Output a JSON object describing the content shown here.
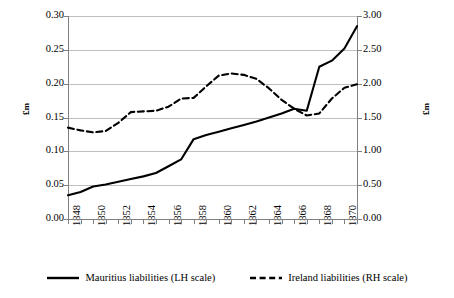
{
  "chart_data": {
    "type": "line",
    "title": "",
    "xlabel": "",
    "ylabel": "£m",
    "y2label": "£m",
    "grid": true,
    "legend_position": "bottom",
    "x": [
      1848,
      1849,
      1850,
      1851,
      1852,
      1853,
      1854,
      1855,
      1856,
      1857,
      1858,
      1859,
      1860,
      1861,
      1862,
      1863,
      1864,
      1865,
      1866,
      1867,
      1868,
      1869,
      1870,
      1871
    ],
    "xtick_labels": [
      "1848",
      "1850",
      "1852",
      "1854",
      "1856",
      "1858",
      "1860",
      "1862",
      "1864",
      "1866",
      "1868",
      "1870"
    ],
    "ylim": [
      0.0,
      0.3
    ],
    "ytick_labels": [
      "0.00",
      "0.05",
      "0.10",
      "0.15",
      "0.20",
      "0.25",
      "0.30"
    ],
    "ytick_values": [
      0.0,
      0.05,
      0.1,
      0.15,
      0.2,
      0.25,
      0.3
    ],
    "y2lim": [
      0.0,
      3.0
    ],
    "y2tick_labels": [
      "0.00",
      "0.50",
      "1.00",
      "1.50",
      "2.00",
      "2.50",
      "3.00"
    ],
    "y2tick_values": [
      0.0,
      0.5,
      1.0,
      1.5,
      2.0,
      2.5,
      3.0
    ],
    "series": [
      {
        "name": "Mauritius liabilities (LH scale)",
        "axis": "left",
        "style": "solid",
        "color": "#000000",
        "values": [
          0.035,
          0.04,
          0.048,
          0.051,
          0.055,
          0.059,
          0.063,
          0.068,
          0.078,
          0.088,
          0.118,
          0.124,
          0.129,
          0.134,
          0.139,
          0.144,
          0.15,
          0.156,
          0.163,
          0.16,
          0.225,
          0.234,
          0.252,
          0.285
        ]
      },
      {
        "name": "Ireland liabilities (RH scale)",
        "axis": "right",
        "style": "dashed",
        "color": "#000000",
        "values": [
          1.35,
          1.31,
          1.28,
          1.3,
          1.42,
          1.58,
          1.59,
          1.6,
          1.66,
          1.78,
          1.79,
          1.96,
          2.12,
          2.15,
          2.13,
          2.07,
          1.93,
          1.76,
          1.63,
          1.53,
          1.56,
          1.78,
          1.94,
          1.99
        ]
      }
    ]
  },
  "legend": {
    "entries": [
      {
        "label": "Mauritius liabilities (LH scale)"
      },
      {
        "label": "Ireland liabilities (RH scale)"
      }
    ]
  }
}
